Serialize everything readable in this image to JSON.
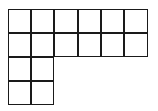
{
  "diagram": {
    "rows": [
      {
        "row": 0,
        "cells": 6
      },
      {
        "row": 1,
        "cells": 6
      },
      {
        "row": 2,
        "cells": 2
      },
      {
        "row": 3,
        "cells": 2
      }
    ],
    "total_squares": 16,
    "line_color": "#1a1a1a",
    "fill_color": "#ffffff"
  }
}
